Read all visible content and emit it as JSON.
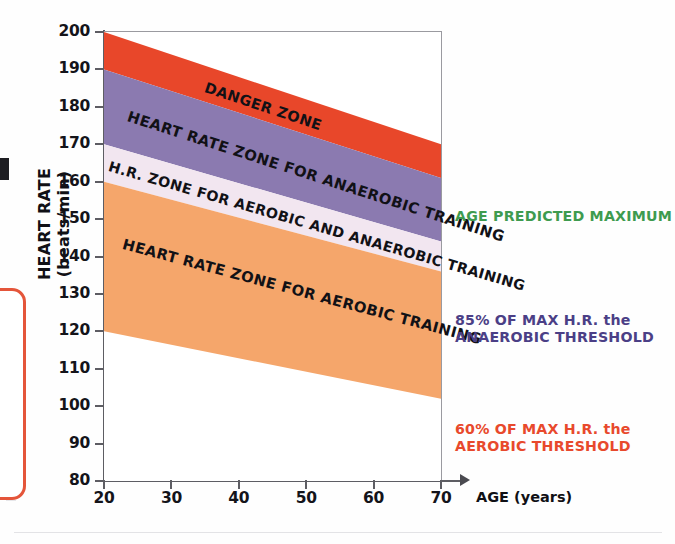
{
  "chart_data": {
    "type": "area",
    "title": "",
    "xlabel": "AGE (years)",
    "ylabel": "HEART RATE (beats/min)",
    "xlim": [
      20,
      70
    ],
    "ylim": [
      80,
      200
    ],
    "x_ticks": [
      20,
      30,
      40,
      50,
      60,
      70
    ],
    "y_ticks": [
      80,
      90,
      100,
      110,
      120,
      130,
      140,
      150,
      160,
      170,
      180,
      190,
      200
    ],
    "grid": false,
    "legend_position": "right",
    "x": [
      20,
      70
    ],
    "bands": [
      {
        "name": "DANGER ZONE",
        "label": "DANGER ZONE",
        "color": "#E8472A",
        "upper": [
          200,
          170
        ],
        "lower": [
          190,
          161
        ]
      },
      {
        "name": "anaerobic-zone",
        "label": "HEART RATE ZONE FOR ANAEROBIC TRAINING",
        "color": "#8B7AB0",
        "upper": [
          190,
          161
        ],
        "lower": [
          170,
          144
        ]
      },
      {
        "name": "aerobic-anaerobic-zone",
        "label": "H.R. ZONE FOR AEROBIC AND ANAEROBIC TRAINING",
        "color": "#F2E6F0",
        "upper": [
          170,
          144
        ],
        "lower": [
          160,
          136
        ]
      },
      {
        "name": "aerobic-zone",
        "label": "HEART RATE ZONE FOR AEROBIC TRAINING",
        "color": "#F5A66B",
        "upper": [
          160,
          136
        ],
        "lower": [
          120,
          102
        ]
      }
    ],
    "annotations": [
      {
        "name": "age-predicted-maximum",
        "text": "AGE PREDICTED MAXIMUM",
        "color": "#3E9B4F",
        "refers_to": 200
      },
      {
        "name": "anaerobic-threshold",
        "text_line1": "85% OF MAX H.R. the",
        "text_line2": "ANAEROBIC THRESHOLD",
        "color": "#4B3F86",
        "refers_to": 170
      },
      {
        "name": "aerobic-threshold",
        "text_line1": "60% OF MAX H.R. the",
        "text_line2": "AEROBIC THRESHOLD",
        "color": "#E8492C",
        "refers_to": 120
      }
    ]
  },
  "axes": {
    "y_title": "HEART RATE (beats/min)",
    "x_title": "AGE (years)",
    "y_ticks": [
      "200",
      "190",
      "180",
      "170",
      "160",
      "150",
      "140",
      "130",
      "120",
      "110",
      "100",
      "90",
      "80"
    ],
    "x_ticks": [
      "20",
      "30",
      "40",
      "50",
      "60",
      "70"
    ]
  },
  "zone_labels": {
    "danger": "DANGER ZONE",
    "anaerobic": "HEART RATE ZONE FOR ANAEROBIC TRAINING",
    "aerobic_anaerobic": "H.R. ZONE FOR AEROBIC AND ANAEROBIC TRAINING",
    "aerobic": "HEART RATE ZONE FOR AEROBIC TRAINING"
  },
  "legend": {
    "max_line": "AGE PREDICTED MAXIMUM",
    "anaerobic_line1": "85% OF MAX H.R. the",
    "anaerobic_line2": "ANAEROBIC THRESHOLD",
    "aerobic_line1": "60% OF MAX H.R. the",
    "aerobic_line2": "AEROBIC THRESHOLD"
  },
  "colors": {
    "danger": "#E8472A",
    "anaerobic": "#8B7AB0",
    "aerobic_anaerobic": "#F2E6F0",
    "aerobic": "#F5A66B",
    "green": "#3E9B4F",
    "purple_text": "#4B3F86",
    "red_text": "#E8492C"
  }
}
